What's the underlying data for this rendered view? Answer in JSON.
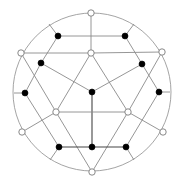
{
  "diagram": {
    "title": "",
    "type": "graph-embedding-in-disk",
    "colors": {
      "edge": "#8a8a8a",
      "edge_dark": "#444444",
      "rim": "#9a9a9a",
      "black_node": "#000000",
      "white_node_fill": "#ffffff",
      "white_node_stroke": "#7a7a7a",
      "background": "#ffffff"
    },
    "node_kinds": [
      "black",
      "white"
    ],
    "nodes": [
      {
        "id": "w_top",
        "kind": "white"
      },
      {
        "id": "w_upper_mid",
        "kind": "white"
      },
      {
        "id": "w_left_upper",
        "kind": "white"
      },
      {
        "id": "w_right_upper",
        "kind": "white"
      },
      {
        "id": "b_top_left",
        "kind": "black"
      },
      {
        "id": "b_top_right",
        "kind": "black"
      },
      {
        "id": "b_mid_left",
        "kind": "black"
      },
      {
        "id": "b_mid_right",
        "kind": "black"
      },
      {
        "id": "b_center",
        "kind": "black"
      },
      {
        "id": "b_left",
        "kind": "black"
      },
      {
        "id": "b_right",
        "kind": "black"
      },
      {
        "id": "w_inner_left",
        "kind": "white"
      },
      {
        "id": "w_inner_right",
        "kind": "white"
      },
      {
        "id": "w_left_lower",
        "kind": "white"
      },
      {
        "id": "w_right_lower",
        "kind": "white"
      },
      {
        "id": "b_bottom_left",
        "kind": "black"
      },
      {
        "id": "b_bottom_mid",
        "kind": "black"
      },
      {
        "id": "b_bottom_right",
        "kind": "black"
      },
      {
        "id": "w_bottom",
        "kind": "white"
      }
    ],
    "edges": [
      [
        "w_top",
        "w_upper_mid"
      ],
      [
        "b_top_left",
        "b_top_right"
      ],
      [
        "w_left_upper",
        "w_upper_mid"
      ],
      [
        "w_upper_mid",
        "w_right_upper"
      ],
      [
        "b_top_left",
        "b_mid_left"
      ],
      [
        "b_top_right",
        "b_mid_right"
      ],
      [
        "b_mid_left",
        "b_center"
      ],
      [
        "b_mid_right",
        "b_center"
      ],
      [
        "b_mid_left",
        "b_left"
      ],
      [
        "b_mid_right",
        "b_right"
      ],
      [
        "b_center",
        "b_bottom_mid"
      ],
      [
        "w_upper_mid",
        "w_inner_left"
      ],
      [
        "w_upper_mid",
        "w_inner_right"
      ],
      [
        "w_inner_left",
        "w_inner_right"
      ],
      [
        "w_left_upper",
        "w_inner_left"
      ],
      [
        "w_right_upper",
        "w_inner_right"
      ],
      [
        "w_inner_left",
        "w_bottom"
      ],
      [
        "w_inner_right",
        "w_bottom"
      ],
      [
        "w_inner_left",
        "w_left_lower"
      ],
      [
        "w_inner_right",
        "w_right_lower"
      ],
      [
        "b_left",
        "b_bottom_left"
      ],
      [
        "b_right",
        "b_bottom_right"
      ],
      [
        "b_bottom_left",
        "b_bottom_mid"
      ],
      [
        "b_bottom_mid",
        "b_bottom_right"
      ]
    ],
    "rim_stubs": [
      "b_top_left",
      "b_top_right",
      "b_left",
      "b_right",
      "b_bottom_left",
      "b_bottom_right"
    ]
  }
}
